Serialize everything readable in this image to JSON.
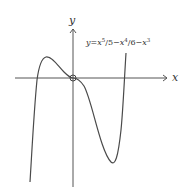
{
  "diagram": {
    "type": "function-graph",
    "axes": {
      "x_label": "x",
      "y_label": "y"
    },
    "equation": {
      "prefix": "y=",
      "var": "x",
      "term1_exp": "5",
      "term1_rest": "/5−",
      "term2_exp": "4",
      "term2_rest": "/6−",
      "term3_exp": "3",
      "full_text": "y=x^5/5−x^4/6−x^3"
    },
    "marked_point": "origin",
    "features": [
      "local maximum left of y-axis",
      "inflection/stationary point at origin",
      "local minimum right of y-axis"
    ],
    "colors": {
      "curve": "#4a4a4a",
      "axes": "#555555",
      "background": "#ffffff"
    }
  }
}
